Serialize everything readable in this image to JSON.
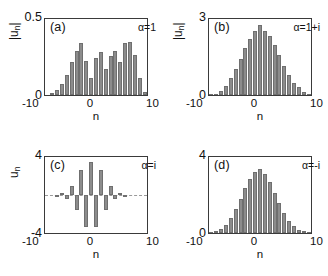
{
  "figure": {
    "type": "multi-panel-bar-figure",
    "panels": 4,
    "bar_color": "#8c8c8c",
    "axis_color": "#3a3a3a",
    "background": "#ffffff"
  },
  "chart_data": [
    {
      "type": "bar",
      "panel": "a",
      "tag": "(a)",
      "annotation": "α=1",
      "title": "",
      "xlabel": "n",
      "ylabel": "|u_n|",
      "ylabel_main": "|u",
      "ylabel_sub": "n",
      "ylabel_tail": "|",
      "xlim": [
        -10,
        10
      ],
      "ylim": [
        0,
        0.5
      ],
      "ytick_top": "0.5",
      "ytick_bottom": "0",
      "xticks": [
        "-10",
        "0",
        "10"
      ],
      "grid": false,
      "signed": false,
      "x": [
        -10,
        -9,
        -8,
        -7,
        -6,
        -5,
        -4,
        -3,
        -2,
        -1,
        0,
        1,
        2,
        3,
        4,
        5,
        6,
        7,
        8,
        9,
        10
      ],
      "values": [
        0.0,
        0.012,
        0.035,
        0.075,
        0.13,
        0.215,
        0.29,
        0.345,
        0.225,
        0.115,
        0.245,
        0.285,
        0.17,
        0.255,
        0.29,
        0.215,
        0.345,
        0.35,
        0.265,
        0.115,
        0.02
      ]
    },
    {
      "type": "bar",
      "panel": "b",
      "tag": "(b)",
      "annotation": "α=1+i",
      "title": "",
      "xlabel": "n",
      "ylabel": "|u_n|",
      "ylabel_main": "|u",
      "ylabel_sub": "n",
      "ylabel_tail": "|",
      "xlim": [
        -10,
        10
      ],
      "ylim": [
        0,
        3
      ],
      "ytick_top": "3",
      "ytick_bottom": "0",
      "xticks": [
        "-10",
        "0",
        "10"
      ],
      "grid": false,
      "signed": false,
      "x": [
        -10,
        -9,
        -8,
        -7,
        -6,
        -5,
        -4,
        -3,
        -2,
        -1,
        0,
        1,
        2,
        3,
        4,
        5,
        6,
        7,
        8,
        9,
        10
      ],
      "values": [
        0.03,
        0.05,
        0.16,
        0.36,
        0.66,
        1.02,
        1.44,
        1.86,
        2.22,
        2.52,
        2.76,
        2.52,
        2.34,
        1.98,
        1.56,
        1.14,
        0.78,
        0.48,
        0.3,
        0.12,
        0.05
      ]
    },
    {
      "type": "bar",
      "panel": "c",
      "tag": "(c)",
      "annotation": "α=i",
      "title": "",
      "xlabel": "n",
      "ylabel": "u_n",
      "ylabel_main": "u",
      "ylabel_sub": "n",
      "ylabel_tail": "",
      "xlim": [
        -10,
        10
      ],
      "ylim": [
        -4,
        4
      ],
      "ytick_top": "4",
      "ytick_bottom": "-4",
      "xticks": [
        "-10",
        "0",
        "10"
      ],
      "grid": false,
      "signed": true,
      "x": [
        -10,
        -9,
        -8,
        -7,
        -6,
        -5,
        -4,
        -3,
        -2,
        -1,
        0,
        1,
        2,
        3,
        4,
        5,
        6,
        7,
        8,
        9,
        10
      ],
      "values": [
        0.0,
        0.04,
        -0.08,
        0.18,
        -0.38,
        1.0,
        -1.6,
        2.6,
        -3.4,
        3.5,
        -3.4,
        2.6,
        -1.6,
        1.0,
        -0.38,
        0.18,
        -0.08,
        0.04,
        0.0,
        0.0,
        0.0
      ]
    },
    {
      "type": "bar",
      "panel": "d",
      "tag": "(d)",
      "annotation": "α=-i",
      "title": "",
      "xlabel": "n",
      "ylabel": "",
      "ylabel_main": "",
      "ylabel_sub": "",
      "ylabel_tail": "",
      "xlim": [
        -10,
        10
      ],
      "ylim": [
        0,
        4
      ],
      "ytick_top": "4",
      "ytick_bottom": "0",
      "xticks": [
        "-10",
        "0",
        "10"
      ],
      "grid": false,
      "signed": false,
      "x": [
        -10,
        -9,
        -8,
        -7,
        -6,
        -5,
        -4,
        -3,
        -2,
        -1,
        0,
        1,
        2,
        3,
        4,
        5,
        6,
        7,
        8,
        9,
        10
      ],
      "values": [
        0.04,
        0.08,
        0.2,
        0.44,
        0.8,
        1.24,
        1.8,
        2.36,
        2.84,
        3.2,
        3.36,
        3.12,
        2.68,
        2.12,
        1.56,
        1.04,
        0.64,
        0.36,
        0.16,
        0.08,
        0.04
      ]
    }
  ]
}
